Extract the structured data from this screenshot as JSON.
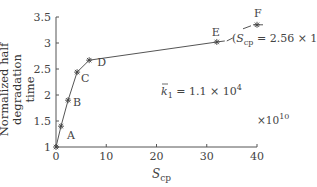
{
  "chart_data": {
    "type": "line",
    "title": "",
    "xlabel": "S_cp",
    "xlabel_main": "S",
    "xlabel_sub": "cp",
    "x_multiplier": "×10^10",
    "x_multiplier_base": "×10",
    "x_multiplier_exp": "10",
    "ylabel": "Normalized half degradation time",
    "ylabel_line1": "Normalized half degradation",
    "ylabel_line2": "time",
    "xlim": [
      0,
      40
    ],
    "ylim": [
      1,
      3.5
    ],
    "xticks": [
      "0",
      "10",
      "20",
      "30",
      "40"
    ],
    "yticks": [
      "1",
      "1.5",
      "2",
      "2.5",
      "3",
      "3.5"
    ],
    "grid": false,
    "legend": null,
    "series": [
      {
        "name": "normalized half degradation time",
        "marker": "asterisk",
        "points": [
          {
            "label": "",
            "x": 0,
            "y": 1.0
          },
          {
            "label": "A",
            "x": 1.0,
            "y": 1.4
          },
          {
            "label": "B",
            "x": 2.4,
            "y": 1.9
          },
          {
            "label": "C",
            "x": 4.2,
            "y": 2.44
          },
          {
            "label": "D",
            "x": 6.6,
            "y": 2.67
          },
          {
            "label": "E",
            "x": 32,
            "y": 3.02
          },
          {
            "label": "F",
            "x": 2560,
            "y": 3.35,
            "note": "axis break; plotted beyond 40"
          }
        ]
      }
    ],
    "annotations": [
      {
        "text": "k̄1 = 1.1 × 10^4",
        "main": "k",
        "sub": "1",
        "rest": " = 1.1 × 10",
        "exp": "4"
      },
      {
        "text": "(S_cp = 2.56 × 10^13)",
        "open": "(",
        "main": "S",
        "sub": "cp",
        "rest": " = 2.56 × 10",
        "exp": "13",
        "close": ")"
      }
    ]
  }
}
